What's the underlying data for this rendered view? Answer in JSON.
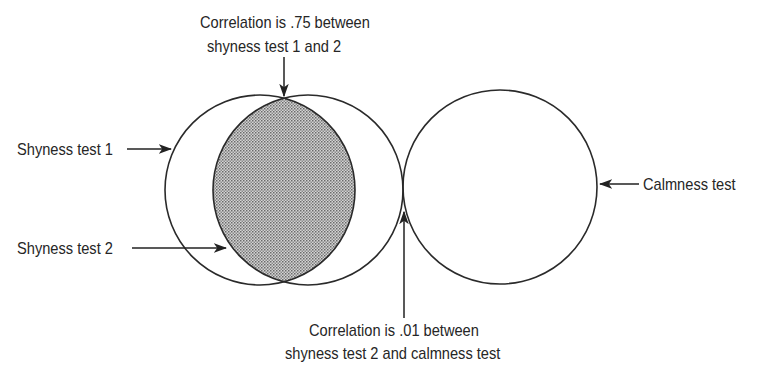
{
  "diagram": {
    "type": "venn-correlation",
    "top_annotation": {
      "line1": "Correlation is .75 between",
      "line2": "shyness test 1 and 2"
    },
    "bottom_annotation": {
      "line1": "Correlation is .01 between",
      "line2": "shyness test 2 and calmness test"
    },
    "labels": {
      "shyness_test_1": "Shyness test 1",
      "shyness_test_2": "Shyness test 2",
      "calmness_test": "Calmness test"
    },
    "circles": [
      {
        "name": "Shyness test 1",
        "cx": 260,
        "cy": 190,
        "r": 95
      },
      {
        "name": "Shyness test 2",
        "cx": 308,
        "cy": 190,
        "r": 95
      },
      {
        "name": "Calmness test",
        "cx": 500,
        "cy": 187,
        "r": 97
      }
    ],
    "correlations": [
      {
        "between": [
          "Shyness test 1",
          "Shyness test 2"
        ],
        "value": 0.75
      },
      {
        "between": [
          "Shyness test 2",
          "Calmness test"
        ],
        "value": 0.01
      }
    ],
    "colors": {
      "stroke": "#2a2a2a",
      "overlap_fill": "#b8b8b8",
      "background": "#ffffff"
    }
  }
}
